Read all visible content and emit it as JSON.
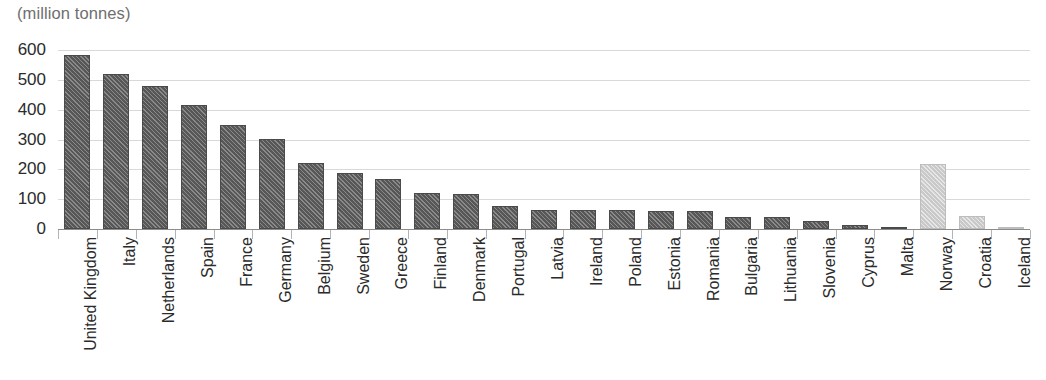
{
  "chart_data": {
    "type": "bar",
    "title": "(million tonnes)",
    "xlabel": "",
    "ylabel": "(million tonnes)",
    "ylim": [
      0,
      600
    ],
    "yticks": [
      0,
      100,
      200,
      300,
      400,
      500,
      600
    ],
    "ytick_labels": [
      "0",
      "100",
      "200",
      "300",
      "400",
      "500",
      "600"
    ],
    "grid": true,
    "legend": "none",
    "categories": [
      "United Kingdom",
      "Italy",
      "Netherlands",
      "Spain",
      "France",
      "Germany",
      "Belgium",
      "Sweden",
      "Greece",
      "Finland",
      "Denmark",
      "Portugal",
      "Latvia",
      "Ireland",
      "Poland",
      "Estonia",
      "Romania",
      "Bulgaria",
      "Lithuania",
      "Slovenia",
      "Cyprus",
      "Malta",
      "Norway",
      "Croatia",
      "Iceland"
    ],
    "values": [
      583,
      520,
      478,
      415,
      350,
      303,
      222,
      188,
      167,
      120,
      118,
      78,
      65,
      64,
      64,
      62,
      60,
      40,
      40,
      27,
      14,
      6,
      218,
      45,
      8
    ],
    "bar_styles": [
      "dark",
      "dark",
      "dark",
      "dark",
      "dark",
      "dark",
      "dark",
      "dark",
      "dark",
      "dark",
      "dark",
      "dark",
      "dark",
      "dark",
      "dark",
      "dark",
      "dark",
      "dark",
      "dark",
      "dark",
      "dark",
      "dark",
      "light",
      "light",
      "light"
    ]
  },
  "colors": {
    "bar_dark": "#575757",
    "bar_light": "#c9c9c9",
    "gridline": "#d9d9d9",
    "axis": "#8c8c8c",
    "text": "#2b2b2b",
    "title_text": "#6e6e6e",
    "background": "#ffffff"
  }
}
